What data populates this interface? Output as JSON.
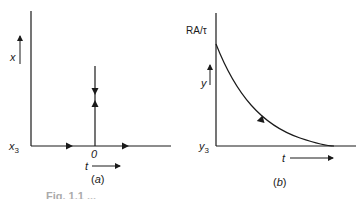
{
  "panel_a": {
    "axis_x_label": "x",
    "origin_label": "x",
    "origin_sub": "3",
    "tick_label": "0",
    "time_label": "t",
    "panel_label": "(a)"
  },
  "panel_b": {
    "top_label": "RA/τ",
    "axis_y_label": "y",
    "origin_label": "y",
    "origin_sub": "3",
    "time_label": "t",
    "panel_label": "(b)"
  },
  "caption_fragment": "Fig. 1.1 ..."
}
